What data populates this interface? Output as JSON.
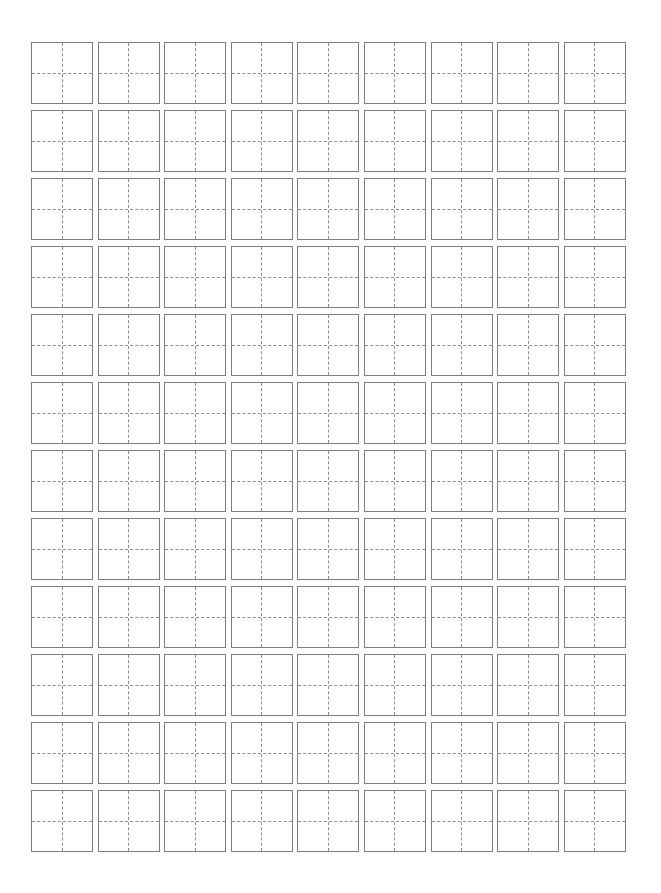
{
  "page": {
    "background_color": "#ffffff",
    "width": 661,
    "height": 893
  },
  "worksheet": {
    "type": "chinese-character-practice-grid",
    "grid_style": "tianzige",
    "columns": 9,
    "rows": 12,
    "total_cells": 108,
    "cell_size_px": 62,
    "column_pitch_px": 66.6,
    "row_pitch_px": 68,
    "origin_x_px": 31,
    "origin_y_px": 42,
    "border_color": "#7d7d7d",
    "border_width_px": 1,
    "guide_color": "#8c8c8c",
    "guide_style": "dashed",
    "guides": [
      "vertical-center",
      "horizontal-center"
    ],
    "cell_background": "#ffffff",
    "cells_content": [
      [
        "",
        "",
        "",
        "",
        "",
        "",
        "",
        "",
        ""
      ],
      [
        "",
        "",
        "",
        "",
        "",
        "",
        "",
        "",
        ""
      ],
      [
        "",
        "",
        "",
        "",
        "",
        "",
        "",
        "",
        ""
      ],
      [
        "",
        "",
        "",
        "",
        "",
        "",
        "",
        "",
        ""
      ],
      [
        "",
        "",
        "",
        "",
        "",
        "",
        "",
        "",
        ""
      ],
      [
        "",
        "",
        "",
        "",
        "",
        "",
        "",
        "",
        ""
      ],
      [
        "",
        "",
        "",
        "",
        "",
        "",
        "",
        "",
        ""
      ],
      [
        "",
        "",
        "",
        "",
        "",
        "",
        "",
        "",
        ""
      ],
      [
        "",
        "",
        "",
        "",
        "",
        "",
        "",
        "",
        ""
      ],
      [
        "",
        "",
        "",
        "",
        "",
        "",
        "",
        "",
        ""
      ],
      [
        "",
        "",
        "",
        "",
        "",
        "",
        "",
        "",
        ""
      ],
      [
        "",
        "",
        "",
        "",
        "",
        "",
        "",
        "",
        ""
      ]
    ]
  }
}
